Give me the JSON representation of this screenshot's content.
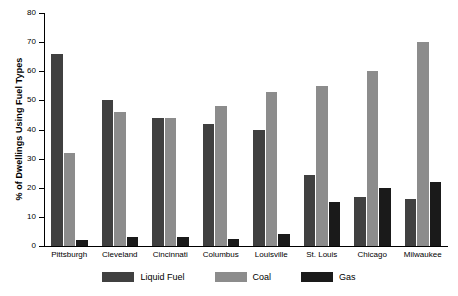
{
  "chart_data": {
    "type": "bar",
    "title": "",
    "subtitle": "",
    "xlabel": "",
    "ylabel": "% of Dwellings Using Fuel Types",
    "ylim": [
      0,
      80
    ],
    "yticks": [
      0,
      10,
      20,
      30,
      40,
      50,
      60,
      70,
      80
    ],
    "grid": false,
    "legend_position": "bottom",
    "categories": [
      "Pittsburgh",
      "Cleveland",
      "Cincinnati",
      "Columbus",
      "Louisville",
      "St. Louis",
      "Chicago",
      "Milwaukee"
    ],
    "series": [
      {
        "name": "Liquid Fuel",
        "color": "#404040",
        "values": [
          66,
          50,
          44,
          42,
          40,
          24.5,
          17,
          16
        ]
      },
      {
        "name": "Coal",
        "color": "#8c8c8c",
        "values": [
          32,
          46,
          44,
          48,
          53,
          55,
          60,
          70
        ]
      },
      {
        "name": "Gas",
        "color": "#1a1a1a",
        "values": [
          2,
          3,
          3,
          2.5,
          4,
          15,
          20,
          22
        ]
      }
    ]
  },
  "axis": {
    "y_tick_labels": [
      "0",
      "10",
      "20",
      "30",
      "40",
      "50",
      "60",
      "70",
      "80"
    ],
    "y_title": "% of Dwellings Using Fuel Types"
  },
  "legend": {
    "entries": [
      {
        "label": "Liquid Fuel",
        "color": "#404040"
      },
      {
        "label": "Coal",
        "color": "#8c8c8c"
      },
      {
        "label": "Gas",
        "color": "#1a1a1a"
      }
    ]
  }
}
